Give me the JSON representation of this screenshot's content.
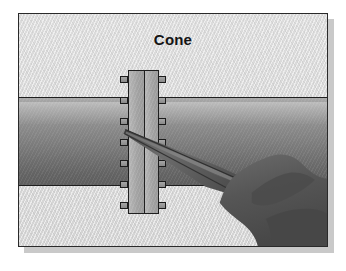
{
  "figure": {
    "title": "Cone",
    "alt_description": "Technical illustration of a bolted pipe flange joint with a hand holding a pointed scraping tool against the flange face",
    "frame": {
      "border_color": "#2a2a2a",
      "shadow_color": "#c9c9c9",
      "background_color": "#d8d8d8"
    }
  },
  "scene": {
    "pipe": {
      "name": "horizontal pipe",
      "top_color": "#a8a8a8",
      "bottom_color": "#5e5e5e",
      "outline_color": "#1e1e1e"
    },
    "flange": {
      "name": "bolted flange pair",
      "plate_fill": "#a2a2a2",
      "outline_color": "#1f1f1f",
      "bolt_fill": "#949494",
      "bolt_count_left": 7,
      "bolt_count_right": 7,
      "bolt_offsets_left": [
        6,
        27,
        48,
        69,
        90,
        111,
        132
      ],
      "bolt_offsets_right": [
        6,
        27,
        48,
        69,
        90,
        111,
        132
      ]
    },
    "tool": {
      "name": "pointed hand tool",
      "body_color": "#6a6a6a",
      "edge_color": "#3b3b3b",
      "tip_x": 124,
      "tip_y": 129
    },
    "hand": {
      "name": "gripping hand",
      "fill_color": "#5a5a5a",
      "shade_color": "#4a4a4a"
    }
  }
}
